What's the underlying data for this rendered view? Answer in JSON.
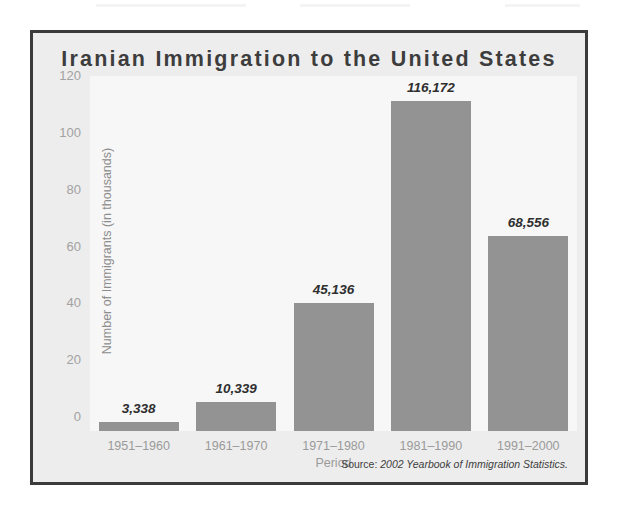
{
  "chart_data": {
    "type": "bar",
    "title": "Iranian Immigration to the United States",
    "xlabel": "Period",
    "ylabel": "Number of Immigrants (in thousands)",
    "categories": [
      "1951–1960",
      "1961–1970",
      "1971–1980",
      "1981–1990",
      "1991–2000"
    ],
    "values": [
      3.338,
      10.339,
      45.136,
      116.172,
      68.556
    ],
    "value_labels": [
      "3,338",
      "10,339",
      "45,136",
      "116,172",
      "68,556"
    ],
    "ylim": [
      0,
      125
    ],
    "yticks": [
      0,
      20,
      40,
      60,
      80,
      100,
      120
    ],
    "ytick_labels": [
      "0",
      "20",
      "40",
      "60",
      "80",
      "100",
      "120"
    ],
    "grid": false,
    "legend": "none",
    "bar_color": "#939393",
    "plot_background": "#f7f7f7",
    "panel_background": "#ededed",
    "frame_color": "#3b3b3b",
    "title_color": "#3d3d3d",
    "axis_text_color": "#9a9a9a",
    "value_label_color": "#2f2f2f"
  },
  "source": {
    "prefix": "Source: ",
    "title": "2002 Yearbook of Immigration Statistics."
  }
}
